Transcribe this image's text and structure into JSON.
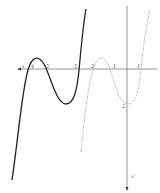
{
  "diagram": {
    "colors": {
      "axis": "#7a7a7a",
      "solid_curve": "#222222",
      "dotted_curve": "#9a9a9a"
    },
    "axis_labels": {
      "x_axis": "x",
      "y_axis": "x'"
    },
    "intercept_labels": [
      {
        "text": "4",
        "x": 31,
        "y": 64
      },
      {
        "text": "5",
        "x": 46,
        "y": 64
      },
      {
        "text": "5",
        "x": 75,
        "y": 64
      },
      {
        "text": "2'",
        "x": 92,
        "y": 64
      },
      {
        "text": "1",
        "x": 114,
        "y": 64
      },
      {
        "text": "1'",
        "x": 137,
        "y": 64
      },
      {
        "text": "2",
        "x": 122,
        "y": 104
      }
    ],
    "curves": [
      {
        "name": "solid-cubic",
        "style": "solid"
      },
      {
        "name": "dotted-cubic",
        "style": "dotted"
      }
    ]
  }
}
